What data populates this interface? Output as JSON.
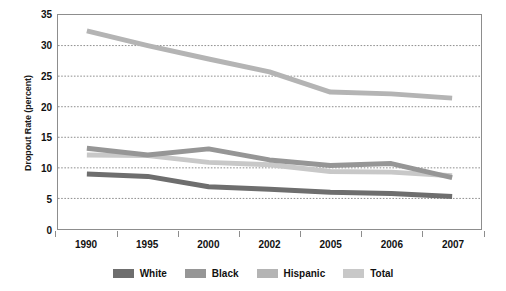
{
  "chart_data": {
    "type": "line",
    "title": "",
    "xlabel": "",
    "ylabel": "Dropout Rate (percent)",
    "categories": [
      "1990",
      "1995",
      "2000",
      "2002",
      "2005",
      "2006",
      "2007"
    ],
    "ylim": [
      0,
      35
    ],
    "yticks": [
      0,
      5,
      10,
      15,
      20,
      25,
      30,
      35
    ],
    "grid": true,
    "legend_position": "bottom",
    "series": [
      {
        "name": "White",
        "color": "#6e6e6e",
        "values": [
          9.0,
          8.6,
          6.9,
          6.5,
          6.0,
          5.8,
          5.3
        ]
      },
      {
        "name": "Black",
        "color": "#969696",
        "values": [
          13.2,
          12.1,
          13.1,
          11.3,
          10.4,
          10.7,
          8.4
        ]
      },
      {
        "name": "Hispanic",
        "color": "#b4b4b4",
        "values": [
          32.4,
          30.0,
          27.8,
          25.7,
          22.4,
          22.1,
          21.4
        ]
      },
      {
        "name": "Total",
        "color": "#c8c8c8",
        "values": [
          12.1,
          12.0,
          10.9,
          10.5,
          9.4,
          9.3,
          8.7
        ]
      }
    ]
  },
  "axis": {
    "y_title": "Dropout Rate (percent)",
    "y_tick_labels": [
      "0",
      "5",
      "10",
      "15",
      "20",
      "25",
      "30",
      "35"
    ],
    "x_tick_labels": [
      "1990",
      "1995",
      "2000",
      "2002",
      "2005",
      "2006",
      "2007"
    ]
  },
  "legend": {
    "items": [
      {
        "label": "White",
        "color": "#6e6e6e"
      },
      {
        "label": "Black",
        "color": "#969696"
      },
      {
        "label": "Hispanic",
        "color": "#b4b4b4"
      },
      {
        "label": "Total",
        "color": "#c8c8c8"
      }
    ]
  },
  "style": {
    "gridline_color": "#8d8d8d",
    "border_color": "#8d8d8d",
    "background": "#ffffff",
    "text_color": "#111111"
  }
}
